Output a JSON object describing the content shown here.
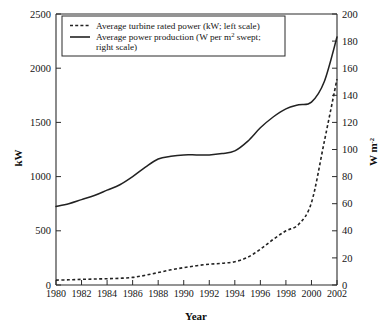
{
  "chart_data": {
    "type": "line",
    "title": "",
    "xlabel": "Year",
    "ylabel": "kW",
    "y2label": "W m⁻²",
    "grid": false,
    "legend_position": "top-left-inside",
    "xlim": [
      1980,
      2002
    ],
    "ylim": [
      0,
      2500
    ],
    "y2lim": [
      0,
      200
    ],
    "xticks": [
      1980,
      1982,
      1984,
      1986,
      1988,
      1990,
      1992,
      1994,
      1996,
      1998,
      2000,
      2002
    ],
    "xticklabels": [
      "1980",
      "1982",
      "1984",
      "1986",
      "1988",
      "1990",
      "1992",
      "1994",
      "1996",
      "1998",
      "2000",
      "2002"
    ],
    "yticks": [
      0,
      500,
      1000,
      1500,
      2000,
      2500
    ],
    "yticklabels": [
      "0",
      "500",
      "1000",
      "1500",
      "2000",
      "2500"
    ],
    "y2ticks": [
      0,
      20,
      40,
      60,
      80,
      100,
      120,
      140,
      160,
      180,
      200
    ],
    "y2ticklabels": [
      "0",
      "20",
      "40",
      "60",
      "80",
      "100",
      "120",
      "140",
      "160",
      "180",
      "200"
    ],
    "x": [
      1980,
      1981,
      1982,
      1983,
      1984,
      1985,
      1986,
      1987,
      1988,
      1989,
      1990,
      1991,
      1992,
      1993,
      1994,
      1995,
      1996,
      1997,
      1998,
      1999,
      2000,
      2001,
      2002
    ],
    "series": [
      {
        "name": "Average turbine rated power (kW; left scale)",
        "axis": "left",
        "style": "dashed",
        "unit": "kW",
        "values": [
          45,
          48,
          52,
          55,
          58,
          62,
          70,
          90,
          115,
          140,
          160,
          178,
          192,
          200,
          215,
          255,
          330,
          420,
          500,
          560,
          760,
          1320,
          1900
        ]
      },
      {
        "name": "Average  power production (W per m² swept; right scale)",
        "axis": "right",
        "style": "solid",
        "unit": "W m-2",
        "values": [
          58,
          60,
          63,
          66,
          70,
          74,
          80,
          87,
          93,
          95,
          96,
          96,
          96,
          97,
          99,
          106,
          116,
          124,
          130,
          133,
          135,
          150,
          183
        ]
      }
    ]
  },
  "legend": {
    "entries": [
      {
        "label": "Average turbine rated power (kW; left scale)",
        "sample": "dashed-line-sample"
      },
      {
        "label_line1": "Average  power production (W per m",
        "label_sup": "2",
        "label_line1_tail": " swept;",
        "label_line2": "right scale)",
        "sample": "solid-line-sample"
      }
    ]
  },
  "axes": {
    "left_title": "kW",
    "right_title_main": "W m",
    "right_title_sup": "-2",
    "bottom_title": "Year"
  }
}
